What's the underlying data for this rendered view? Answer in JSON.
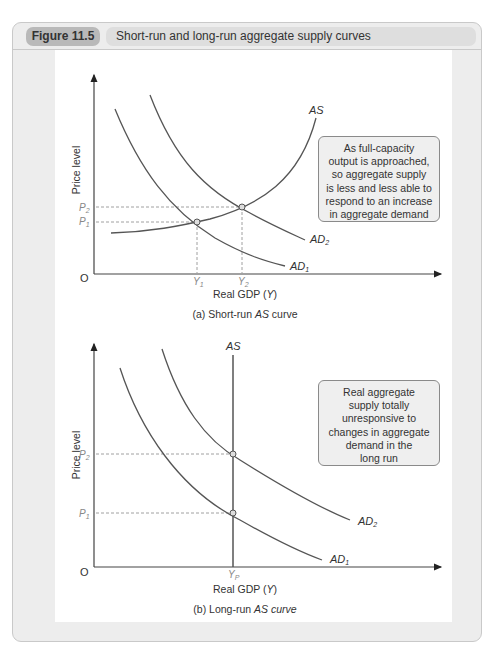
{
  "figure": {
    "number_label": "Figure 11.5",
    "title": "Short-run and long-run aggregate supply curves"
  },
  "panel_a": {
    "caption_prefix": "(a) Short-run ",
    "caption_italic": "AS",
    "caption_suffix": " curve",
    "ylabel": "Price level",
    "xlabel_prefix": "Real GDP (",
    "xlabel_var": "Y",
    "xlabel_suffix": ")",
    "origin": "O",
    "p2": "P",
    "p2_sub": "2",
    "p1": "P",
    "p1_sub": "1",
    "y1": "Y",
    "y1_sub": "1",
    "y2": "Y",
    "y2_sub": "2",
    "as_label": "AS",
    "ad1": "AD",
    "ad1_sub": "1",
    "ad2": "AD",
    "ad2_sub": "2",
    "callout": [
      "As full-capacity",
      "output is approached,",
      "so aggregate supply",
      "is less and less able to",
      "respond to an increase",
      "in aggregate demand"
    ]
  },
  "panel_b": {
    "caption_prefix": "(b) Long-run ",
    "caption_italic": "AS curve",
    "ylabel": "Price level",
    "xlabel_prefix": "Real GDP (",
    "xlabel_var": "Y",
    "xlabel_suffix": ")",
    "origin": "O",
    "p2": "P",
    "p2_sub": "2",
    "p1": "P",
    "p1_sub": "1",
    "yp": "Y",
    "yp_sub": "P",
    "as_label": "AS",
    "ad1": "AD",
    "ad1_sub": "1",
    "ad2": "AD",
    "ad2_sub": "2",
    "callout": [
      "Real aggregate",
      "supply totally",
      "unresponsive to",
      "changes in aggregate",
      "demand in the",
      "long run"
    ]
  },
  "colors": {
    "frame": "#ededed",
    "tag": "#b9b9b9",
    "title_bar": "#dedede",
    "curve": "#555555",
    "dashed": "#888888"
  }
}
